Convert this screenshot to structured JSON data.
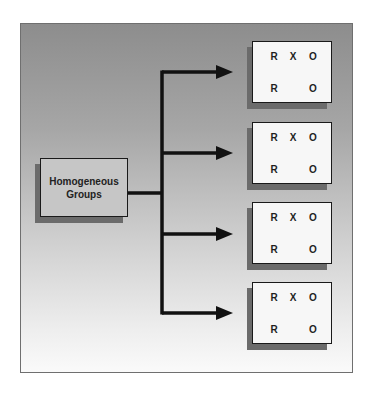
{
  "diagram": {
    "source": {
      "line1": "Homogeneous",
      "line2": "Groups"
    },
    "groups": [
      {
        "row1": [
          "R",
          "X",
          "O"
        ],
        "row2": [
          "R",
          "",
          "O"
        ]
      },
      {
        "row1": [
          "R",
          "X",
          "O"
        ],
        "row2": [
          "R",
          "",
          "O"
        ]
      },
      {
        "row1": [
          "R",
          "X",
          "O"
        ],
        "row2": [
          "R",
          "",
          "O"
        ]
      },
      {
        "row1": [
          "R",
          "X",
          "O"
        ],
        "row2": [
          "R",
          "",
          "O"
        ]
      }
    ],
    "colors": {
      "line": "#111111",
      "box_fill": "#f7f7f7",
      "source_fill": "#c6c6c6",
      "shadow": "#6b6b6b"
    }
  }
}
